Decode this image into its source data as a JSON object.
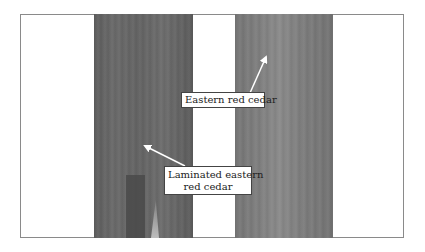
{
  "figure": {
    "labels": {
      "eastern": "Eastern red cedar",
      "laminated_line1": "Laminated eastern",
      "laminated_line2": "red cedar"
    },
    "colors": {
      "background": "#ffffff",
      "frame_border": "#8a8a8a",
      "left_strip": "#646464",
      "right_strip": "#7f7f7f",
      "arrow": "#ffffff",
      "label_border": "#444444",
      "label_text": "#222222"
    },
    "arrows": [
      {
        "name": "eastern-arrow",
        "from": [
          250,
          93
        ],
        "to": [
          267,
          55
        ]
      },
      {
        "name": "laminated-arrow",
        "from": [
          185,
          166
        ],
        "to": [
          143,
          145
        ]
      }
    ]
  }
}
